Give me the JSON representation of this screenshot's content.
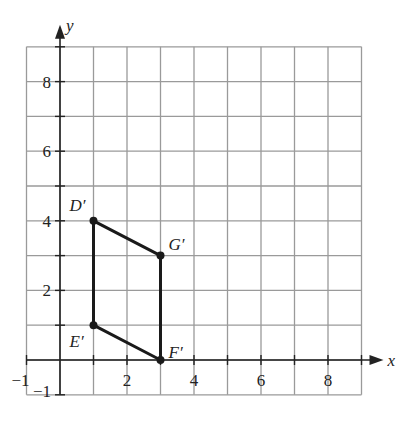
{
  "chart_data": {
    "type": "scatter",
    "title": "",
    "xlabel": "x",
    "ylabel": "y",
    "xlim": [
      -1,
      9
    ],
    "ylim": [
      -1,
      9
    ],
    "grid": true,
    "x_ticks": [
      "-1",
      "2",
      "4",
      "6",
      "8"
    ],
    "y_ticks": [
      "-1",
      "2",
      "4",
      "6",
      "8"
    ],
    "points": [
      {
        "label": "D′",
        "x": 1,
        "y": 4
      },
      {
        "label": "G′",
        "x": 3,
        "y": 3
      },
      {
        "label": "F′",
        "x": 3,
        "y": 0
      },
      {
        "label": "E′",
        "x": 1,
        "y": 1
      }
    ],
    "polygon": [
      "D′",
      "G′",
      "F′",
      "E′"
    ]
  }
}
